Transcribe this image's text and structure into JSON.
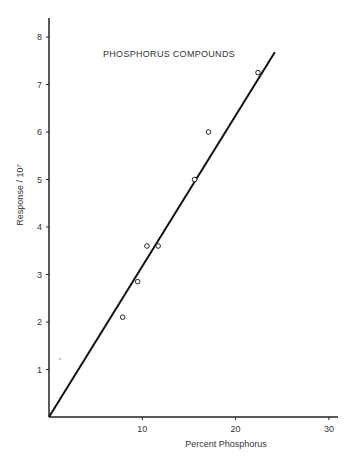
{
  "chart_data": {
    "type": "scatter",
    "title": "PHOSPHORUS COMPOUNDS",
    "xlabel": "Percent Phosphorus",
    "ylabel": "Response / 10⁷",
    "xlim": [
      0,
      31
    ],
    "ylim": [
      0,
      8.4
    ],
    "x_ticks": [
      10,
      20,
      30
    ],
    "y_ticks": [
      1,
      2,
      3,
      4,
      5,
      6,
      7,
      8
    ],
    "grid": false,
    "legend": null,
    "series": [
      {
        "name": "data points",
        "marker": "open-circle",
        "points": [
          {
            "x": 7.9,
            "y": 2.1
          },
          {
            "x": 9.5,
            "y": 2.85
          },
          {
            "x": 10.5,
            "y": 3.6
          },
          {
            "x": 11.7,
            "y": 3.6
          },
          {
            "x": 15.6,
            "y": 5.0
          },
          {
            "x": 17.1,
            "y": 6.0
          },
          {
            "x": 22.4,
            "y": 7.25
          }
        ]
      },
      {
        "name": "fit line",
        "type": "line",
        "points": [
          {
            "x": 0,
            "y": 0
          },
          {
            "x": 24.2,
            "y": 7.68
          }
        ]
      }
    ]
  }
}
